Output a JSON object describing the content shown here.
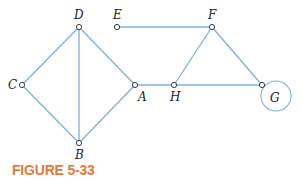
{
  "figure": {
    "caption": "FIGURE 5-33",
    "caption_color": "#e07b3a",
    "edge_color": "#7fb0d6",
    "node_stroke": "#3a3a3a"
  },
  "graph": {
    "vertices": [
      {
        "id": "A",
        "label": "A",
        "x": 135,
        "y": 85,
        "lx": 138,
        "ly": 101
      },
      {
        "id": "B",
        "label": "B",
        "x": 79,
        "y": 143,
        "lx": 75,
        "ly": 159
      },
      {
        "id": "C",
        "label": "C",
        "x": 22,
        "y": 85,
        "lx": 8,
        "ly": 89
      },
      {
        "id": "D",
        "label": "D",
        "x": 79,
        "y": 27,
        "lx": 74,
        "ly": 19
      },
      {
        "id": "E",
        "label": "E",
        "x": 117,
        "y": 27,
        "lx": 113,
        "ly": 19
      },
      {
        "id": "F",
        "label": "F",
        "x": 212,
        "y": 27,
        "lx": 208,
        "ly": 19
      },
      {
        "id": "G",
        "label": "G",
        "x": 262,
        "y": 85,
        "lx": 270,
        "ly": 102
      },
      {
        "id": "H",
        "label": "H",
        "x": 174,
        "y": 85,
        "lx": 170,
        "ly": 101
      }
    ],
    "edges": [
      [
        "D",
        "C"
      ],
      [
        "C",
        "B"
      ],
      [
        "D",
        "B"
      ],
      [
        "D",
        "A"
      ],
      [
        "A",
        "B"
      ],
      [
        "A",
        "H"
      ],
      [
        "E",
        "F"
      ],
      [
        "F",
        "H"
      ],
      [
        "F",
        "G"
      ],
      [
        "H",
        "G"
      ]
    ],
    "loops": [
      {
        "vertex": "G",
        "cx": 276,
        "cy": 96,
        "r": 15
      }
    ]
  }
}
